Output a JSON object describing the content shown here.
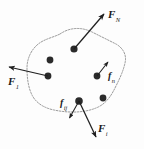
{
  "figure": {
    "caption": "Rigid body with external and internal forces acting on constituent particles",
    "body_outline_color": "#8a8a8a",
    "particle_color": "#2b2b2b",
    "arrow_color": "#1f1f1f",
    "background_color": "#fdfdfd"
  },
  "labels": {
    "f_external_top_right": {
      "symbol": "F",
      "subscript": "N"
    },
    "f_external_left": {
      "symbol": "F",
      "subscript": "1"
    },
    "f_external_bottom_right": {
      "symbol": "F",
      "subscript": "i"
    },
    "f_internal_right": {
      "symbol": "f",
      "subscript": "n"
    },
    "f_internal_bottom": {
      "symbol": "f",
      "subscript": "ij"
    }
  },
  "particles": [
    {
      "name": "particle-top-center",
      "x": 74,
      "y": 49
    },
    {
      "name": "particle-upper-left",
      "x": 50,
      "y": 60
    },
    {
      "name": "particle-mid-left",
      "x": 48,
      "y": 76
    },
    {
      "name": "particle-mid-right",
      "x": 97,
      "y": 76
    },
    {
      "name": "particle-lower-right",
      "x": 103,
      "y": 98
    },
    {
      "name": "particle-bottom-center",
      "x": 79,
      "y": 101
    }
  ],
  "arrows": [
    {
      "name": "arrow-F-N",
      "from": [
        74,
        49
      ],
      "to": [
        105,
        13
      ],
      "kind": "external"
    },
    {
      "name": "arrow-F-1",
      "from": [
        48,
        76
      ],
      "to": [
        8,
        67
      ],
      "kind": "external"
    },
    {
      "name": "arrow-F-i",
      "from": [
        79,
        101
      ],
      "to": [
        97,
        138
      ],
      "kind": "external"
    },
    {
      "name": "arrow-f-n",
      "from": [
        97,
        76
      ],
      "to": [
        108,
        61
      ],
      "kind": "internal"
    },
    {
      "name": "arrow-f-ij",
      "from": [
        79,
        101
      ],
      "to": [
        69,
        119
      ],
      "kind": "internal"
    }
  ]
}
